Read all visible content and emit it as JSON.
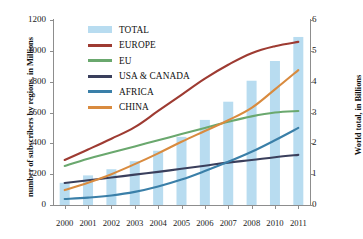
{
  "chart_data": {
    "type": "bar",
    "title": "",
    "subtitle": "",
    "xlabel": "",
    "ylabel": "number of subscribers by regions, in Millions",
    "ylabel_secondary": "World total, in Billions",
    "categories": [
      "2000",
      "2001",
      "2002",
      "2003",
      "2004",
      "2005",
      "2006",
      "2007",
      "2008",
      "2010",
      "2011"
    ],
    "ylim": [
      0,
      1200
    ],
    "yticks": [
      0,
      200,
      400,
      600,
      800,
      1000,
      1200
    ],
    "ylim_secondary": [
      0,
      6
    ],
    "yticks_secondary": [
      0,
      1,
      2,
      3,
      4,
      5,
      6
    ],
    "grid": false,
    "legend_position": "top-left-inside",
    "bar_series": {
      "name": "TOTAL",
      "axis": "secondary",
      "unit": "Billions",
      "color": "#b8dcf0",
      "values": [
        0.72,
        0.96,
        1.16,
        1.42,
        1.76,
        2.21,
        2.76,
        3.35,
        4.03,
        4.67,
        5.45
      ]
    },
    "series": [
      {
        "name": "EUROPE",
        "axis": "primary",
        "unit": "Millions",
        "color": "#9e3b32",
        "values": [
          292,
          360,
          430,
          505,
          610,
          715,
          820,
          910,
          985,
          1030,
          1058
        ]
      },
      {
        "name": "EU",
        "axis": "primary",
        "unit": "Millions",
        "color": "#6aa86e",
        "values": [
          253,
          300,
          340,
          380,
          420,
          460,
          500,
          540,
          575,
          600,
          610
        ]
      },
      {
        "name": "USA & CANADA",
        "axis": "primary",
        "unit": "Millions",
        "color": "#3a3f5c",
        "values": [
          143,
          160,
          178,
          197,
          215,
          235,
          255,
          275,
          292,
          310,
          325
        ]
      },
      {
        "name": "AFRICA",
        "axis": "primary",
        "unit": "Millions",
        "color": "#3a7fa8",
        "values": [
          39,
          48,
          62,
          85,
          120,
          165,
          220,
          280,
          345,
          420,
          500
        ]
      },
      {
        "name": "CHINA",
        "axis": "primary",
        "unit": "Millions",
        "color": "#d98b3f",
        "values": [
          97,
          145,
          200,
          265,
          335,
          410,
          480,
          550,
          630,
          750,
          875
        ]
      }
    ],
    "legend": [
      {
        "label": "TOTAL",
        "color": "#b8dcf0",
        "marker": "bar"
      },
      {
        "label": "EUROPE",
        "color": "#9e3b32",
        "marker": "line"
      },
      {
        "label": "EU",
        "color": "#6aa86e",
        "marker": "line"
      },
      {
        "label": "USA & CANADA",
        "color": "#3a3f5c",
        "marker": "line"
      },
      {
        "label": "AFRICA",
        "color": "#3a7fa8",
        "marker": "line"
      },
      {
        "label": "CHINA",
        "color": "#d98b3f",
        "marker": "line"
      }
    ]
  }
}
